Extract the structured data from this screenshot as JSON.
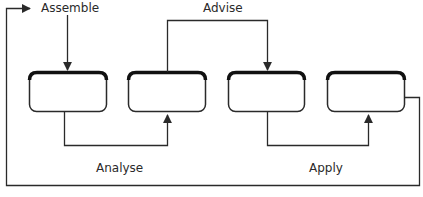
{
  "diagram": {
    "type": "process-cycle",
    "stages": [
      {
        "id": "box-1",
        "label": ""
      },
      {
        "id": "box-2",
        "label": ""
      },
      {
        "id": "box-3",
        "label": ""
      },
      {
        "id": "box-4",
        "label": ""
      }
    ],
    "labels": {
      "assemble": "Assemble",
      "advise": "Advise",
      "analyse": "Analyse",
      "apply": "Apply"
    },
    "connections": [
      {
        "from": "Assemble",
        "to": "box-1",
        "label": "Assemble"
      },
      {
        "from": "box-1",
        "to": "box-2",
        "label": "Analyse"
      },
      {
        "from": "box-2",
        "to": "box-3",
        "label": "Advise"
      },
      {
        "from": "box-3",
        "to": "box-4",
        "label": "Apply"
      },
      {
        "from": "box-4",
        "to": "Assemble",
        "label": "feedback loop"
      }
    ],
    "colors": {
      "stroke": "#2a2a2a",
      "box_top": "#111111",
      "background": "#ffffff"
    }
  }
}
